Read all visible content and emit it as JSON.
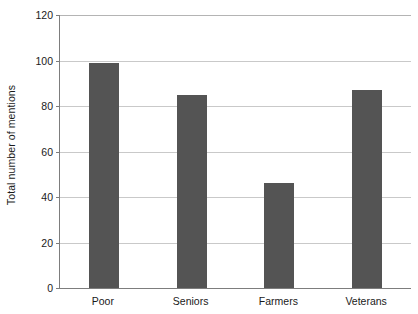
{
  "chart_data": {
    "type": "bar",
    "title": "",
    "subtitle": "",
    "xlabel": "",
    "ylabel": "Total number of mentions",
    "categories": [
      "Poor",
      "Seniors",
      "Farmers",
      "Veterans"
    ],
    "values": [
      99,
      85,
      46,
      87
    ],
    "series": [
      {
        "name": "Total number of mentions",
        "values": [
          99,
          85,
          46,
          87
        ]
      }
    ],
    "ylim": [
      0,
      120
    ],
    "yticks": [
      0,
      20,
      40,
      60,
      80,
      100,
      120
    ],
    "ytick_labels": [
      "0",
      "20",
      "40",
      "60",
      "80",
      "100",
      "120"
    ],
    "grid": true,
    "grid_axis": "y",
    "legend": false,
    "legend_position": "none",
    "bar_color": "#545454",
    "gridline_color": "#c9c9c9",
    "axis_color": "#7d7d7d",
    "background_color": "#ffffff",
    "annotations": []
  }
}
